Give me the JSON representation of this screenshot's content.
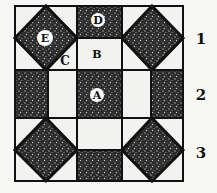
{
  "diagram": {
    "type": "quilt-block",
    "grid": "3x3",
    "patch_labels": {
      "A": "A",
      "B": "B",
      "C": "C",
      "D": "D",
      "E": "E"
    },
    "row_labels": [
      "1",
      "2",
      "3"
    ],
    "colors": {
      "fabric_dark": "#2a2a2a",
      "fabric_light": "#f2f2f0",
      "border": "#111111"
    }
  }
}
